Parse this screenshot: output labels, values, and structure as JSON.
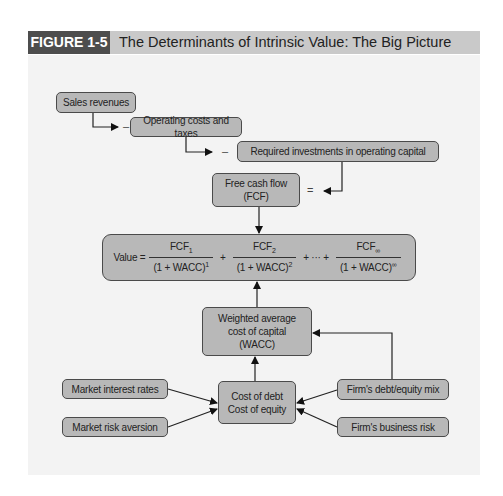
{
  "figure": {
    "label": "FIGURE 1-5",
    "title": "The Determinants of Intrinsic Value: The Big Picture"
  },
  "nodes": {
    "sales_revenues": "Sales revenues",
    "operating_costs": "Operating costs and taxes",
    "required_investments": "Required investments in operating capital",
    "fcf_line1": "Free cash flow",
    "fcf_line2": "(FCF)",
    "wacc_line1": "Weighted average",
    "wacc_line2": "cost of capital",
    "wacc_line3": "(WACC)",
    "cost_line1": "Cost of debt",
    "cost_line2": "Cost of equity",
    "market_interest_rates": "Market interest rates",
    "market_risk_aversion": "Market risk aversion",
    "firm_debt_equity_mix": "Firm's debt/equity mix",
    "firm_business_risk": "Firm's business risk"
  },
  "operators": {
    "minus": "–",
    "equals": "="
  },
  "value_equation": {
    "lhs": "Value =",
    "terms": [
      {
        "num": "FCF",
        "num_sub": "1",
        "den": "(1 + WACC)",
        "den_sup": "1"
      },
      {
        "num": "FCF",
        "num_sub": "2",
        "den": "(1 + WACC)",
        "den_sup": "2"
      },
      {
        "num": "FCF",
        "num_sub": "∞",
        "den": "(1 + WACC)",
        "den_sup": "∞"
      }
    ],
    "plus": "+",
    "ellipsis": "+ ··· +"
  }
}
